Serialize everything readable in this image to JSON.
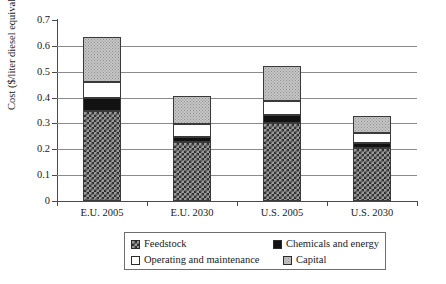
{
  "chart_data": {
    "type": "bar",
    "stacked": true,
    "title": "",
    "xlabel": "",
    "ylabel": "Cost ($/liter diesel equivalent)",
    "ylim": [
      0,
      0.7
    ],
    "ytick_labels": [
      "0.7",
      "0.6",
      "0.5",
      "0.4",
      "0.3",
      "0.2",
      "0.1",
      "0"
    ],
    "ytick_values": [
      0.7,
      0.6,
      0.5,
      0.4,
      0.3,
      0.2,
      0.1,
      0
    ],
    "grid": true,
    "legend_position": "bottom",
    "categories": [
      "E.U. 2005",
      "E.U. 2030",
      "U.S. 2005",
      "U.S. 2030"
    ],
    "series": [
      {
        "name": "Feedstock",
        "values": [
          0.35,
          0.228,
          0.303,
          0.205
        ],
        "color": "#9a9a9a",
        "pattern": "checkered"
      },
      {
        "name": "Chemicals and energy",
        "values": [
          0.05,
          0.018,
          0.03,
          0.02
        ],
        "color": "#121212",
        "pattern": "solid-black"
      },
      {
        "name": "Operating and maintenance",
        "values": [
          0.06,
          0.053,
          0.055,
          0.038
        ],
        "color": "#ffffff",
        "pattern": "solid-white"
      },
      {
        "name": "Capital",
        "values": [
          0.175,
          0.108,
          0.134,
          0.065
        ],
        "color": "#c6c6c6",
        "pattern": "dotted-gray"
      }
    ],
    "totals": [
      0.635,
      0.407,
      0.522,
      0.328
    ]
  },
  "legend": {
    "items": [
      {
        "label": "Feedstock"
      },
      {
        "label": "Chemicals and energy"
      },
      {
        "label": "Operating and maintenance"
      },
      {
        "label": "Capital"
      }
    ]
  }
}
